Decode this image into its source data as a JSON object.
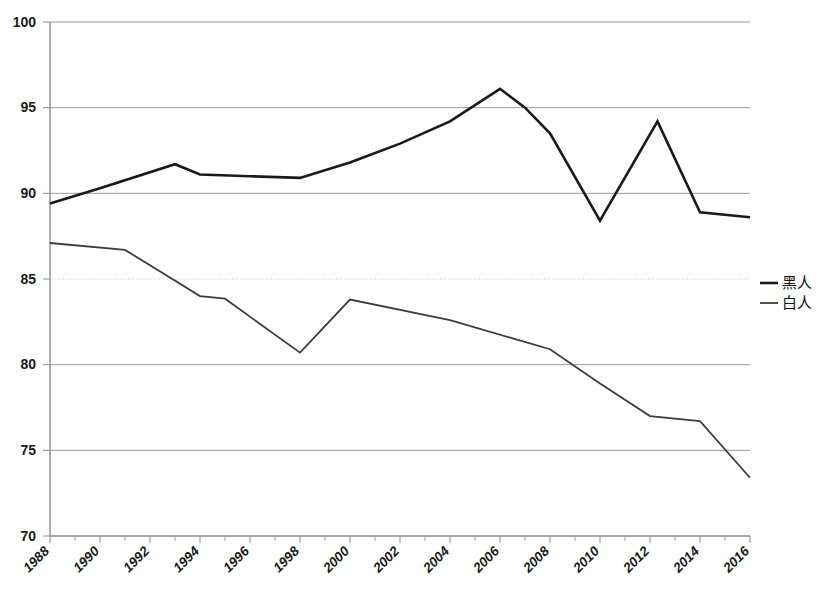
{
  "chart_data": {
    "type": "line",
    "title": "",
    "subtitle": "",
    "xlabel": "",
    "ylabel": "",
    "xlim": [
      1988,
      2016
    ],
    "ylim": [
      70,
      100
    ],
    "grid": true,
    "legend_position": "right",
    "y_ticks": [
      "70",
      "75",
      "80",
      "85",
      "90",
      "95",
      "100"
    ],
    "y_tick_values": [
      70,
      75,
      80,
      85,
      90,
      95,
      100
    ],
    "x_ticks": [
      "1988",
      "1990",
      "1992",
      "1994",
      "1996",
      "1998",
      "2000",
      "2002",
      "2004",
      "2006",
      "2008",
      "2010",
      "2012",
      "2014",
      "2016"
    ],
    "x_tick_values": [
      1988,
      1990,
      1992,
      1994,
      1996,
      1998,
      2000,
      2002,
      2004,
      2006,
      2008,
      2010,
      2012,
      2014,
      2016
    ],
    "x_minor_step": 1,
    "series": [
      {
        "name": "黑人",
        "color": "#1a1a1a",
        "stroke_width": 2.6,
        "x": [
          1988,
          1990,
          1993,
          1994,
          1996,
          1998,
          2000,
          2002,
          2004,
          2006,
          2007,
          2008,
          2010,
          2012.3,
          2014,
          2016
        ],
        "values": [
          89.4,
          90.3,
          91.7,
          91.1,
          91.0,
          90.9,
          91.8,
          92.9,
          94.2,
          96.1,
          95.0,
          93.5,
          88.4,
          94.2,
          88.9,
          88.6
        ]
      },
      {
        "name": "白人",
        "color": "#3d3d3d",
        "stroke_width": 1.8,
        "x": [
          1988,
          1991,
          1994,
          1995,
          1998,
          2000,
          2004,
          2008,
          2010,
          2012,
          2014,
          2016
        ],
        "values": [
          87.1,
          86.7,
          84.0,
          83.85,
          80.7,
          83.8,
          82.6,
          80.9,
          78.9,
          77.0,
          76.7,
          73.4
        ]
      }
    ]
  },
  "legend": {
    "items": [
      {
        "label": "黑人",
        "color": "#1a1a1a",
        "stroke_width": 2.6
      },
      {
        "label": "白人",
        "color": "#3d3d3d",
        "stroke_width": 1.8
      }
    ]
  }
}
